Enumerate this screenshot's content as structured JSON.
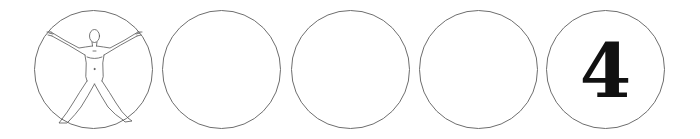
{
  "sequence": {
    "items": [
      {
        "index": 1,
        "content": "human-figure-icon",
        "label": ""
      },
      {
        "index": 2,
        "content": "empty",
        "label": ""
      },
      {
        "index": 3,
        "content": "empty",
        "label": ""
      },
      {
        "index": 4,
        "content": "empty",
        "label": ""
      },
      {
        "index": 5,
        "content": "number",
        "label": "4"
      }
    ],
    "circle_stroke_color": "#6e6e6e",
    "number_color": "#111111"
  }
}
